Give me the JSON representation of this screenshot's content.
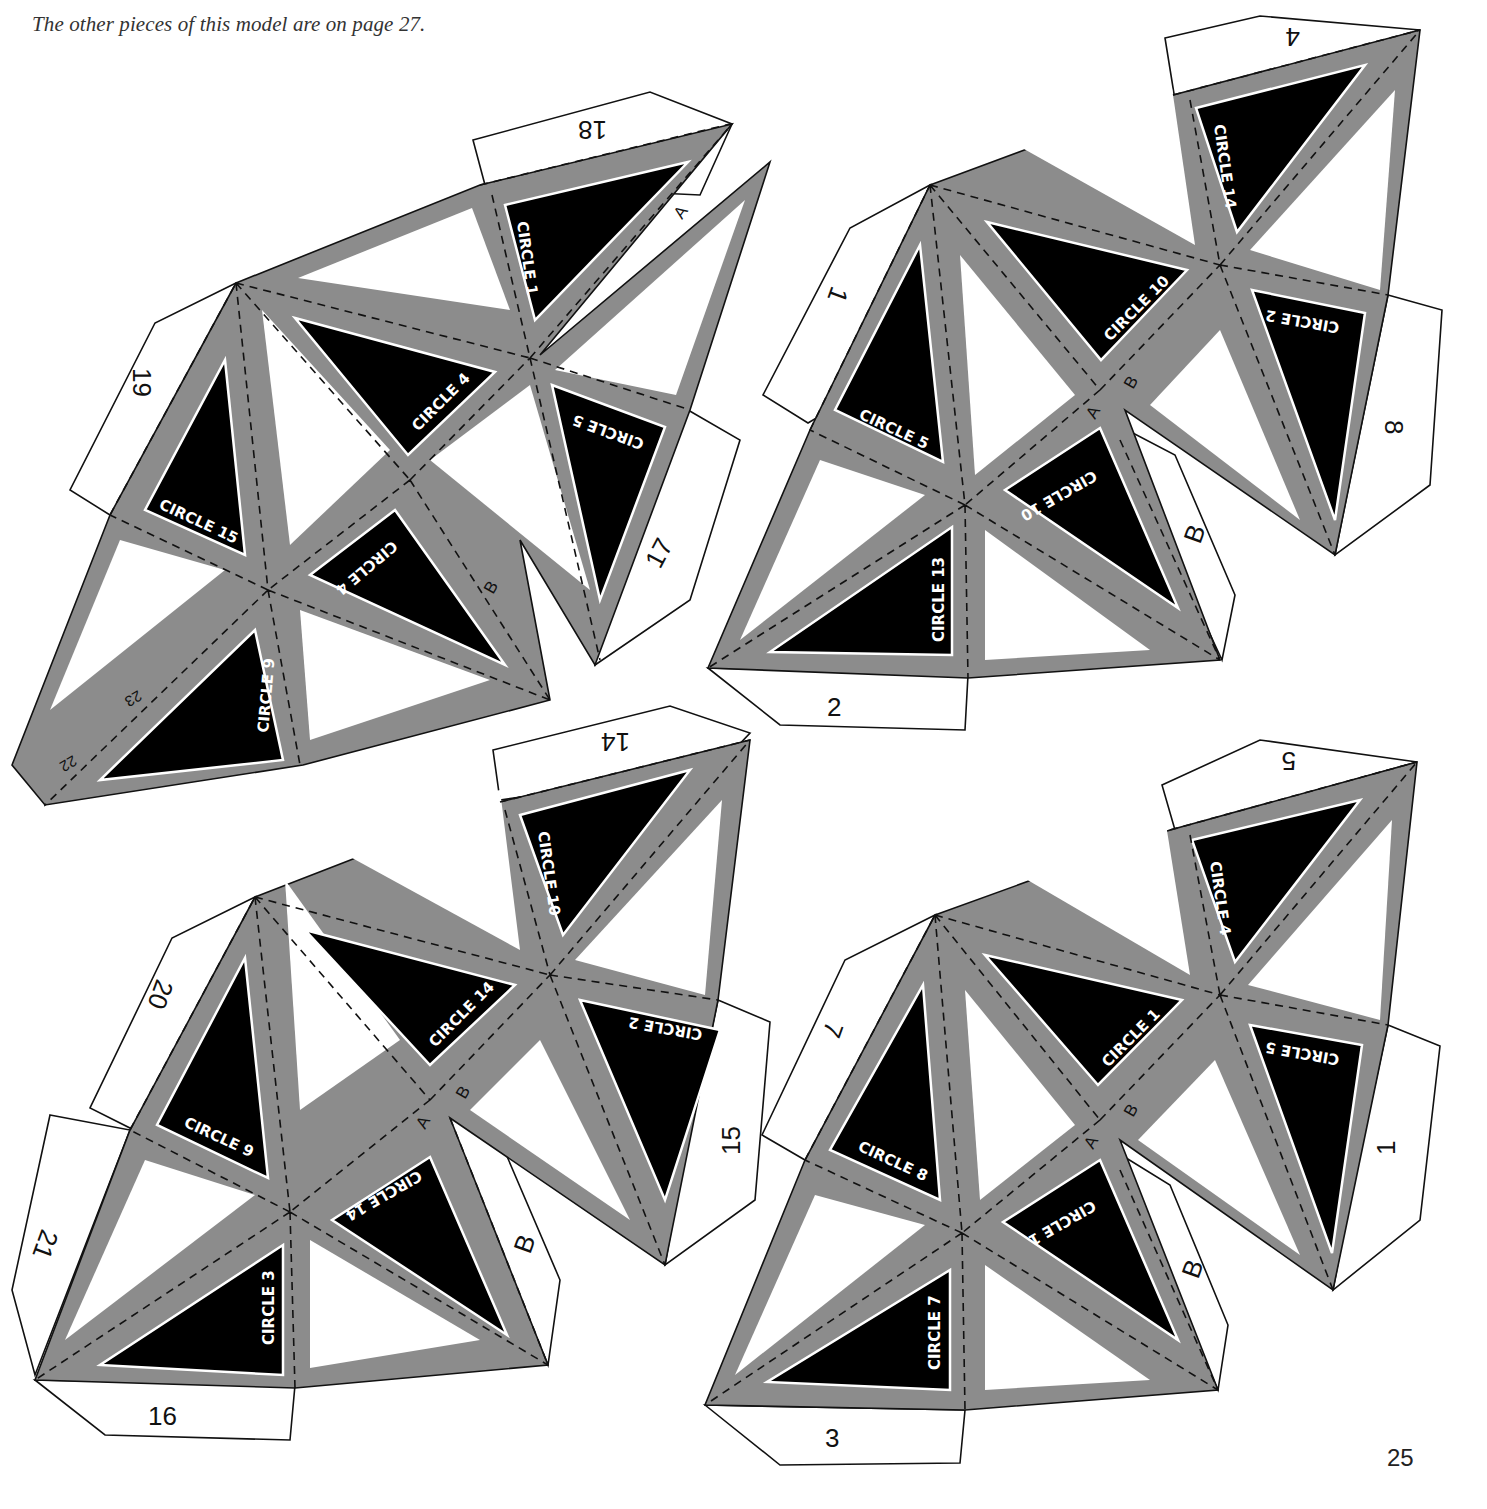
{
  "page": {
    "caption": "The other pieces of this model are on page 27.",
    "caption_top_fragment": "... on page ...",
    "page_number": "25"
  },
  "colors": {
    "band_gray": "#8c8c8c",
    "face_dark": "#000000",
    "face_light": "#ffffff",
    "outline": "#111111"
  },
  "nets": [
    {
      "id": "net-top-left",
      "tabs": [
        "18",
        "19",
        "17",
        "22",
        "23"
      ],
      "letters": [
        "A",
        "B"
      ],
      "faces": [
        {
          "label": "CIRCLE 1"
        },
        {
          "label": "CIRCLE 4"
        },
        {
          "label": "CIRCLE 5"
        },
        {
          "label": "CIRCLE 15"
        },
        {
          "label": "CIRCLE 4"
        },
        {
          "label": "CIRCLE 9"
        }
      ]
    },
    {
      "id": "net-top-right",
      "tabs": [
        "4",
        "1",
        "8",
        "2"
      ],
      "letters": [
        "A",
        "B",
        "B"
      ],
      "faces": [
        {
          "label": "CIRCLE 14"
        },
        {
          "label": "CIRCLE 10"
        },
        {
          "label": "CIRCLE 2"
        },
        {
          "label": "CIRCLE 5"
        },
        {
          "label": "CIRCLE 10"
        },
        {
          "label": "CIRCLE 13"
        }
      ]
    },
    {
      "id": "net-bottom-left",
      "tabs": [
        "14",
        "20",
        "15",
        "21",
        "16"
      ],
      "letters": [
        "A",
        "B",
        "B"
      ],
      "faces": [
        {
          "label": "CIRCLE 10"
        },
        {
          "label": "CIRCLE 14"
        },
        {
          "label": "CIRCLE 2"
        },
        {
          "label": "CIRCLE 9"
        },
        {
          "label": "CIRCLE 14"
        },
        {
          "label": "CIRCLE 3"
        }
      ]
    },
    {
      "id": "net-bottom-right",
      "tabs": [
        "5",
        "7",
        "1",
        "3"
      ],
      "letters": [
        "A",
        "B",
        "B"
      ],
      "faces": [
        {
          "label": "CIRCLE 4"
        },
        {
          "label": "CIRCLE 1"
        },
        {
          "label": "CIRCLE 5"
        },
        {
          "label": "CIRCLE 8"
        },
        {
          "label": "CIRCLE 1"
        },
        {
          "label": "CIRCLE 7"
        }
      ]
    }
  ]
}
